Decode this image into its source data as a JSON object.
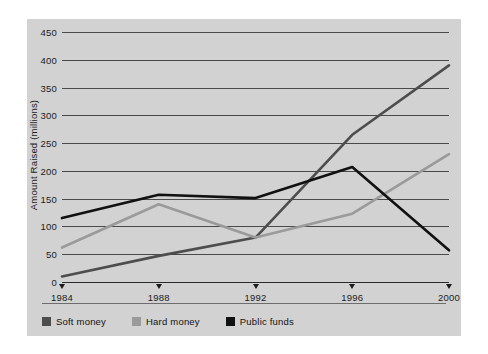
{
  "chart_data": {
    "type": "line",
    "title": "",
    "xlabel": "",
    "ylabel": "Amount Raised (millions)",
    "categories": [
      "1984",
      "1988",
      "1992",
      "1996",
      "2000"
    ],
    "x": [
      1984,
      1988,
      1992,
      1996,
      2000
    ],
    "ylim": [
      0,
      450
    ],
    "ytick_labels": [
      "0",
      "50",
      "100",
      "150",
      "200",
      "250",
      "300",
      "350",
      "400",
      "450"
    ],
    "ytick_values": [
      0,
      50,
      100,
      150,
      200,
      250,
      300,
      350,
      400,
      450
    ],
    "grid": true,
    "legend_position": "bottom-left",
    "series": [
      {
        "name": "Soft money",
        "color": "#4d4d4d",
        "values": [
          10,
          47,
          80,
          265,
          390
        ]
      },
      {
        "name": "Hard money",
        "color": "#9a9a9a",
        "values": [
          62,
          140,
          80,
          123,
          230
        ]
      },
      {
        "name": "Public funds",
        "color": "#111111",
        "values": [
          115,
          157,
          151,
          207,
          57
        ]
      }
    ]
  },
  "legend": {
    "items": [
      {
        "label": "Soft money",
        "color": "#4d4d4d"
      },
      {
        "label": "Hard money",
        "color": "#9a9a9a"
      },
      {
        "label": "Public funds",
        "color": "#111111"
      }
    ]
  },
  "colors": {
    "panel_background": "#d2d2d2",
    "page_background": "#ffffff",
    "gridline": "#4a4a4a",
    "axis": "#2a2a2a",
    "text": "#1b1b1b"
  }
}
